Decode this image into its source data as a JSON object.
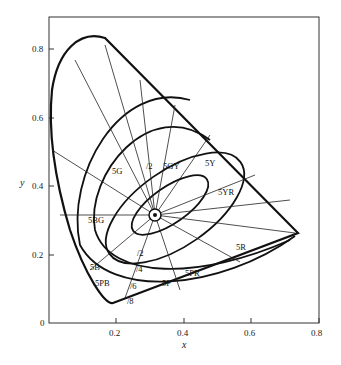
{
  "figure": {
    "type": "CIE 1931 chromaticity diagram with Munsell hue/chroma loci",
    "x_axis": {
      "label": "x",
      "ticks": [
        "0.2",
        "0.4",
        "0.6",
        "0.8"
      ]
    },
    "y_axis": {
      "label": "y",
      "ticks": [
        "0",
        "0.2",
        "0.4",
        "0.6",
        "0.8"
      ]
    },
    "hue_labels": [
      "5G",
      "5GY",
      "5Y",
      "5YR",
      "5BG",
      "5R",
      "5B",
      "5PB",
      "5P",
      "5PR"
    ],
    "chroma_labels": [
      "/2",
      "/2",
      "/4",
      "/6",
      "/8"
    ],
    "caption": "Figure caption (illegible)"
  }
}
